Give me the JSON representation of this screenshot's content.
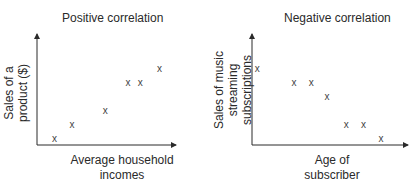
{
  "chart_data": [
    {
      "type": "scatter",
      "title": "Positive correlation",
      "xlabel": "Average household incomes",
      "ylabel": "Sales of a product ($)",
      "marker": "x",
      "grid": false,
      "ticks": "none",
      "points": [
        {
          "x": 1.0,
          "y": 0.5
        },
        {
          "x": 2.0,
          "y": 1.5
        },
        {
          "x": 3.9,
          "y": 2.5
        },
        {
          "x": 5.2,
          "y": 4.5
        },
        {
          "x": 5.9,
          "y": 4.5
        },
        {
          "x": 7.0,
          "y": 5.5
        }
      ],
      "xlim": [
        0,
        8
      ],
      "ylim": [
        0,
        8
      ]
    },
    {
      "type": "scatter",
      "title": "Negative correlation",
      "xlabel": "Age of subscriber",
      "ylabel": "Sales of music streaming subscriptions",
      "marker": "x",
      "grid": false,
      "ticks": "none",
      "points": [
        {
          "x": 0.3,
          "y": 5.5
        },
        {
          "x": 2.4,
          "y": 4.5
        },
        {
          "x": 3.4,
          "y": 4.5
        },
        {
          "x": 4.3,
          "y": 3.5
        },
        {
          "x": 5.4,
          "y": 1.5
        },
        {
          "x": 6.4,
          "y": 1.5
        },
        {
          "x": 7.4,
          "y": 0.5
        }
      ],
      "xlim": [
        0,
        9
      ],
      "ylim": [
        0,
        8
      ]
    }
  ],
  "labels": {
    "left": {
      "title": "Positive correlation",
      "xlabel_line1": "Average household",
      "xlabel_line2": "incomes",
      "ylabel_line1": "Sales of a",
      "ylabel_line2": "product ($)"
    },
    "right": {
      "title": "Negative correlation",
      "xlabel_line1": "Age of",
      "xlabel_line2": "subscriber",
      "ylabel_line1": "Sales of music",
      "ylabel_line2": "streaming",
      "ylabel_line3": "subscriptions"
    },
    "marker_glyph": "x"
  },
  "colors": {
    "axis": "#2a2a2a",
    "marker": "#444444",
    "text": "#2a2a2a"
  }
}
